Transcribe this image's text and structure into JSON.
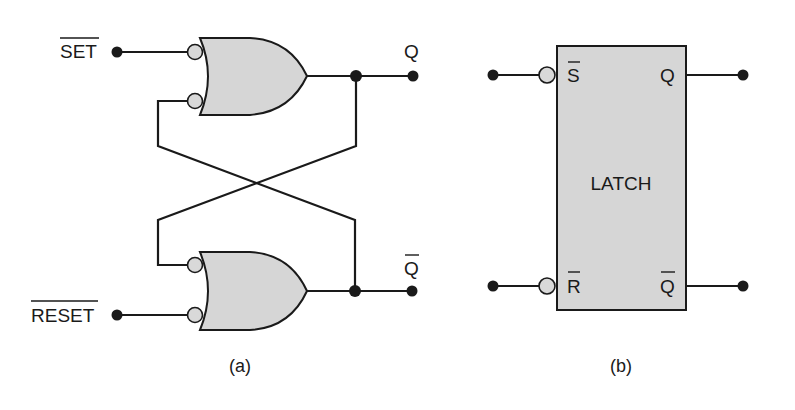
{
  "figure_a": {
    "caption": "(a)",
    "inputs": {
      "set_label": "SET",
      "set_overbar": true,
      "reset_label": "RESET",
      "reset_overbar": true
    },
    "outputs": {
      "q_label": "Q",
      "qbar_label": "Q",
      "qbar_overbar": true
    },
    "gates": [
      {
        "name": "top-or-gate",
        "type": "OR",
        "inverted_inputs": 2
      },
      {
        "name": "bottom-or-gate",
        "type": "OR",
        "inverted_inputs": 2
      }
    ],
    "cross_coupled": true
  },
  "figure_b": {
    "caption": "(b)",
    "block_label": "LATCH",
    "pins": {
      "s_label": "S",
      "s_overbar": true,
      "r_label": "R",
      "r_overbar": true,
      "q_label": "Q",
      "qbar_label": "Q",
      "qbar_overbar": true
    }
  },
  "colors": {
    "line": "#1a1a1a",
    "fill": "#d6d6d6",
    "background": "#ffffff"
  }
}
